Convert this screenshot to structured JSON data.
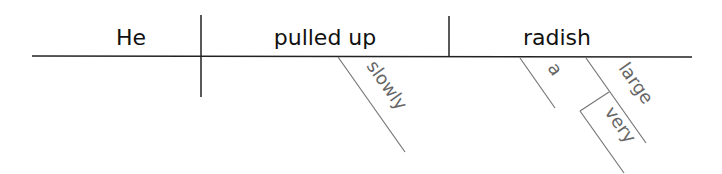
{
  "diagram": {
    "type": "sentence-diagram",
    "sentence": "He slowly pulled up a very large radish",
    "baseline": {
      "subject": "He",
      "verb": "pulled up",
      "direct_object": "radish"
    },
    "modifiers": {
      "verb_adverb": "slowly",
      "object_article": "a",
      "object_adjective": "large",
      "adjective_adverb": "very"
    },
    "colors": {
      "main_line": "#222222",
      "main_text": "#111111",
      "modifier_line": "#777777",
      "modifier_text": "#666666"
    }
  }
}
